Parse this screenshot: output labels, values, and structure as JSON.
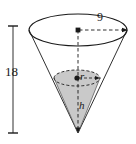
{
  "figure": {
    "type": "geometry-diagram",
    "title": "",
    "colors": {
      "stroke": "#1a1a1a",
      "shaded_fill": "#c9c9c9",
      "background": "#ffffff",
      "dashed_stroke": "#1a1a1a"
    },
    "outer_cone": {
      "name": "outer-cone",
      "orientation": "apex-down",
      "height_label": "18",
      "radius_label": "9",
      "top_ellipse": {
        "center_x": 78,
        "center_y": 30,
        "rx": 49,
        "ry": 16
      },
      "apex": {
        "x": 78,
        "y": 133
      }
    },
    "inner_cone": {
      "name": "inscribed-cone",
      "shaded": true,
      "radius_label": "r",
      "height_label": "h",
      "top_ellipse": {
        "center_x": 77,
        "center_y": 78,
        "rx": 23,
        "ry": 8
      },
      "apex": {
        "x": 78,
        "y": 133
      }
    },
    "dimension_line": {
      "name": "height-dimension-18",
      "label": "18",
      "x": 13,
      "y_top": 26,
      "y_bottom": 133,
      "tick_half_width": 5
    },
    "labels": {
      "outer_radius": "9",
      "outer_height": "18",
      "inner_radius": "r",
      "inner_height": "h"
    }
  }
}
